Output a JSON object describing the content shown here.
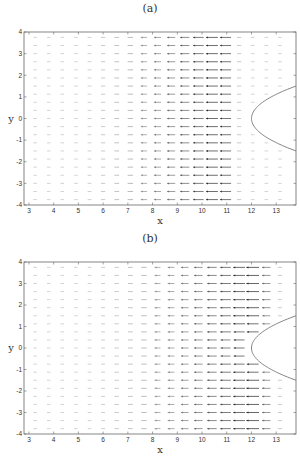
{
  "chart_data": [
    {
      "type": "quiver",
      "panel_label": "(a)",
      "xlabel": "x",
      "ylabel": "y",
      "xlim": [
        2.8,
        13.8
      ],
      "ylim": [
        -4,
        4
      ],
      "xticks": [
        3,
        4,
        5,
        6,
        7,
        8,
        9,
        10,
        11,
        12,
        13
      ],
      "yticks": [
        4,
        3,
        2,
        1,
        0,
        -1,
        -2,
        -3,
        -4
      ],
      "grid": false,
      "boundary": {
        "shape": "parabola",
        "vertex_x": 12.0,
        "vertex_y": 0,
        "opens": "right",
        "top_exit_y": 1.5,
        "bottom_exit_y": -1.5
      },
      "field": {
        "direction": "leftward",
        "peak_x": 10.8,
        "zero_beyond_x": 11.6,
        "description": "Leftward arrows, magnitude growing from near-zero at x≈3 to max near x≈10.5–11.3, ending before boundary"
      }
    },
    {
      "type": "quiver",
      "panel_label": "(b)",
      "xlabel": "x",
      "ylabel": "y",
      "xlim": [
        2.8,
        13.8
      ],
      "ylim": [
        -4,
        4
      ],
      "xticks": [
        3,
        4,
        5,
        6,
        7,
        8,
        9,
        10,
        11,
        12,
        13
      ],
      "yticks": [
        4,
        3,
        2,
        1,
        0,
        -1,
        -2,
        -3,
        -4
      ],
      "grid": false,
      "boundary": {
        "shape": "parabola",
        "vertex_x": 12.0,
        "vertex_y": 0,
        "opens": "right",
        "top_exit_y": 1.5,
        "bottom_exit_y": -1.5
      },
      "field": {
        "direction": "leftward",
        "peak_x": 12.0,
        "zero_beyond_x": 13.3,
        "description": "Leftward arrows, magnitude growing toward x≈12 and continuing up to the boundary"
      }
    }
  ]
}
